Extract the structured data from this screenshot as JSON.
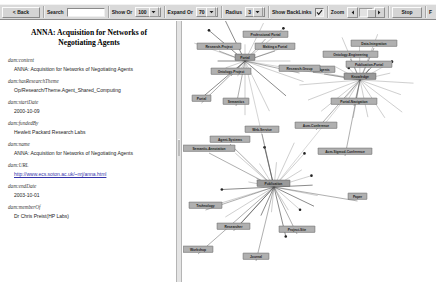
{
  "window": {
    "title": "ANNA: Acquisition for Networks of Negotiating Agents"
  },
  "toolbar": {
    "back_label": "< Back",
    "search_label": "Search",
    "search_value": "",
    "search_placeholder": "",
    "show_label": "Show Or",
    "show_value": "100",
    "expand_label": "Expand Or",
    "expand_value": "70",
    "radius_label": "Radius",
    "radius_value": "3",
    "backlinks_label": "Show BackLinks",
    "backlinks_checked": true,
    "zoom_label": "Zoom",
    "zoom_value": 62,
    "stop_label": "Stop",
    "menu_label": "F"
  },
  "document": {
    "title": "ANNA: Acquisition for Networks of Negotiating Agents",
    "fields": [
      {
        "prop": "dam:content",
        "value": "ANNA: Acquisition for Networks of Negotiating Agents",
        "link": false
      },
      {
        "prop": "dam:hasResearchTheme",
        "value": "Op/Research/Theme.Agent_Shared_Computing",
        "link": false
      },
      {
        "prop": "dam:startDate",
        "value": "2000-10-09",
        "link": false
      },
      {
        "prop": "dam:fundedBy",
        "value": "Hewlett Packard Research Labs",
        "link": false
      },
      {
        "prop": "dam:name",
        "value": "ANNA: Acquisition for Networks of Negotiating Agents",
        "link": false
      },
      {
        "prop": "dam:URL",
        "value": "http://www.ecs.soton.ac.uk/~nrj/anna.html",
        "link": true
      },
      {
        "prop": "dam:endDate",
        "value": "2003-10-01",
        "link": false
      },
      {
        "prop": "dam:memberOf",
        "value": "Dr Chris Preist(HP Labs)",
        "link": false
      }
    ]
  },
  "graph": {
    "nodes": [
      {
        "id": "n1",
        "label": "Professional Portal",
        "x": 60,
        "y": 13,
        "w": 45,
        "hub": false
      },
      {
        "id": "n2",
        "label": "Research-Project",
        "x": 14,
        "y": 25,
        "w": 44,
        "hub": false
      },
      {
        "id": "n3",
        "label": "Making a Portal",
        "x": 72,
        "y": 25,
        "w": 40,
        "hub": false
      },
      {
        "id": "n4",
        "label": "Portal",
        "x": 52,
        "y": 36,
        "w": 20,
        "hub": true
      },
      {
        "id": "n5",
        "label": "Agents",
        "x": 130,
        "y": 48,
        "w": 22,
        "hub": false
      },
      {
        "id": "n6",
        "label": "Ontology-Project",
        "x": 28,
        "y": 50,
        "w": 40,
        "hub": false
      },
      {
        "id": "n7",
        "label": "Portal",
        "x": 9,
        "y": 77,
        "w": 19,
        "hub": false
      },
      {
        "id": "n8",
        "label": "Semantics",
        "x": 40,
        "y": 80,
        "w": 26,
        "hub": false
      },
      {
        "id": "n9",
        "label": "Data-Integration",
        "x": 168,
        "y": 22,
        "w": 46,
        "hub": false
      },
      {
        "id": "n10",
        "label": "Ontology-Engineering",
        "x": 140,
        "y": 33,
        "w": 55,
        "hub": false
      },
      {
        "id": "n11",
        "label": "Publication-Portal",
        "x": 163,
        "y": 43,
        "w": 46,
        "hub": false
      },
      {
        "id": "n12",
        "label": "Research-Group",
        "x": 96,
        "y": 47,
        "w": 41,
        "hub": false
      },
      {
        "id": "n13",
        "label": "Knowledge",
        "x": 161,
        "y": 55,
        "w": 32,
        "hub": true
      },
      {
        "id": "n14",
        "label": "Portal-Navigation",
        "x": 148,
        "y": 80,
        "w": 46,
        "hub": false
      },
      {
        "id": "n15",
        "label": "Acm-Conference",
        "x": 112,
        "y": 104,
        "w": 42,
        "hub": false
      },
      {
        "id": "n16",
        "label": "Web-Service",
        "x": 62,
        "y": 108,
        "w": 34,
        "hub": false
      },
      {
        "id": "n17",
        "label": "Agent-Systems",
        "x": 27,
        "y": 118,
        "w": 40,
        "hub": false
      },
      {
        "id": "n18",
        "label": "Semantic-Annotation",
        "x": 0,
        "y": 127,
        "w": 52,
        "hub": false
      },
      {
        "id": "n19",
        "label": "Acm-Sigmod-Conference",
        "x": 135,
        "y": 130,
        "w": 54,
        "hub": false
      },
      {
        "id": "n20",
        "label": "Publication",
        "x": 74,
        "y": 162,
        "w": 33,
        "hub": true
      },
      {
        "id": "n21",
        "label": "Paper",
        "x": 165,
        "y": 175,
        "w": 19,
        "hub": false
      },
      {
        "id": "n22",
        "label": "Technology",
        "x": 6,
        "y": 184,
        "w": 33,
        "hub": false
      },
      {
        "id": "n23",
        "label": "Researcher",
        "x": 34,
        "y": 205,
        "w": 33,
        "hub": false
      },
      {
        "id": "n24",
        "label": "Project-Site",
        "x": 96,
        "y": 208,
        "w": 36,
        "hub": false
      },
      {
        "id": "n25",
        "label": "Workshop",
        "x": 0,
        "y": 228,
        "w": 30,
        "hub": false
      },
      {
        "id": "n26",
        "label": "Journal",
        "x": 60,
        "y": 235,
        "w": 26,
        "hub": false
      }
    ],
    "hub_centers": [
      {
        "x": 62,
        "y": 40
      },
      {
        "x": 177,
        "y": 59
      },
      {
        "x": 91,
        "y": 166
      }
    ]
  },
  "colors": {
    "toolbar_bg": "#d9d9d9",
    "node_fill": "#b0b0b0",
    "node_stroke": "#4a4a4a",
    "edge": "#555555",
    "link_text": "#3333aa",
    "pane_bg": "#ffffff"
  }
}
